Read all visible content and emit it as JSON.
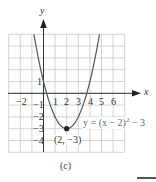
{
  "figure": {
    "caption": "(c)",
    "equation": {
      "prefix": "y = (x − 2)",
      "exponent": "2",
      "suffix": " − 3"
    },
    "vertex_label": "(2, −3)",
    "axes": {
      "x_label": "x",
      "y_label": "y",
      "x_ticks": [
        "−2",
        "1",
        "2",
        "3",
        "4",
        "5",
        "6"
      ],
      "y_ticks": [
        "1",
        "−1",
        "−2",
        "−3",
        "−4"
      ]
    },
    "colors": {
      "grid": "#c8c8c8",
      "axis": "#333333",
      "curve": "#555555",
      "point": "#222222"
    }
  },
  "chart_data": {
    "type": "line",
    "title": "(c)",
    "function": "y = (x - 2)^2 - 3",
    "xlabel": "x",
    "ylabel": "y",
    "xlim": [
      -3,
      7
    ],
    "ylim": [
      -5,
      5
    ],
    "grid": true,
    "x_tick_labels": [
      -2,
      1,
      2,
      3,
      4,
      5,
      6
    ],
    "y_tick_labels": [
      1,
      -1,
      -2,
      -3,
      -4
    ],
    "series": [
      {
        "name": "y = (x − 2)^2 − 3",
        "x": [
          -0.83,
          -0.5,
          0,
          0.5,
          1,
          1.5,
          2,
          2.5,
          3,
          3.5,
          4,
          4.5,
          4.83
        ],
        "y": [
          5,
          3.25,
          1,
          -0.75,
          -2,
          -2.75,
          -3,
          -2.75,
          -2,
          -0.75,
          1,
          3.25,
          5
        ]
      }
    ],
    "annotations": [
      {
        "point": [
          2,
          -3
        ],
        "label": "(2, −3)",
        "marker": "filled-circle"
      },
      {
        "text": "y = (x − 2)^2 − 3",
        "position": [
          4.3,
          -2.6
        ]
      }
    ]
  },
  "decorations": {
    "bottom_right_rule": true
  }
}
